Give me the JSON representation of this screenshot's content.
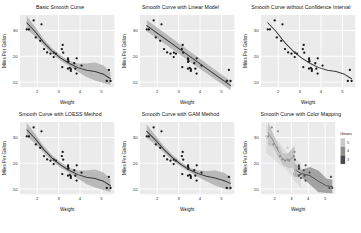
{
  "figure": {
    "caption": "",
    "axis": {
      "xlabel": "Weight",
      "ylabel": "Miles Per Gallon"
    },
    "legend": {
      "title": "Gears",
      "labels": [
        "3",
        "4",
        "5"
      ],
      "position": "right"
    },
    "colors": {
      "panel_bg": "#ebebeb",
      "grid": "#ffffff",
      "point": "#1a1a1a",
      "smooth_line": "#3b3b3b",
      "ribbon": "#b0b0b0",
      "gear3": "#4a4a4a",
      "gear4": "#8f8f8f",
      "gear5": "#c9c9c9"
    }
  },
  "chart_data": [
    {
      "type": "scatter",
      "title": "Basic Smooth Curve",
      "xlabel": "Weight",
      "ylabel": "Miles Per Gallon",
      "xlim": [
        1.2,
        5.6
      ],
      "ylim": [
        8,
        36
      ],
      "xticks": [
        2,
        3,
        4,
        5
      ],
      "yticks": [
        10,
        20,
        30
      ],
      "grid": true,
      "smooth_method": "loess",
      "confidence_interval": true,
      "x": [
        2.62,
        2.875,
        2.32,
        3.215,
        3.44,
        3.46,
        3.57,
        3.19,
        3.15,
        3.44,
        3.44,
        4.07,
        3.73,
        3.78,
        5.25,
        5.424,
        5.345,
        2.2,
        1.615,
        1.835,
        2.465,
        3.52,
        3.435,
        3.84,
        3.845,
        1.935,
        2.14,
        1.513,
        3.17,
        2.77,
        3.57,
        2.78
      ],
      "y": [
        21,
        21,
        22.8,
        21.4,
        18.7,
        18.1,
        14.3,
        24.4,
        22.8,
        19.2,
        17.8,
        16.4,
        17.3,
        15.2,
        10.4,
        10.4,
        14.7,
        32.4,
        30.4,
        33.9,
        21.5,
        15.5,
        15.2,
        13.3,
        19.2,
        27.3,
        26,
        30.4,
        15.8,
        19.7,
        15,
        21.4
      ],
      "smooth_x": [
        1.513,
        1.9,
        2.3,
        2.7,
        3.1,
        3.5,
        3.9,
        4.3,
        4.7,
        5.1,
        5.424
      ],
      "smooth_y": [
        33.0,
        29.6,
        25.4,
        22.0,
        19.3,
        17.2,
        15.6,
        14.6,
        14.1,
        13.0,
        11.3
      ],
      "ribbon_lo": [
        30.4,
        27.8,
        24.1,
        20.9,
        18.3,
        16.2,
        14.0,
        12.0,
        10.6,
        9.6,
        8.9
      ],
      "ribbon_hi": [
        35.6,
        31.4,
        26.7,
        23.1,
        20.3,
        18.2,
        17.2,
        17.2,
        17.6,
        16.4,
        13.7
      ]
    },
    {
      "type": "scatter",
      "title": "Smooth Curve with Linear Model",
      "xlabel": "Weight",
      "ylabel": "Miles Per Gallon",
      "xlim": [
        1.2,
        5.6
      ],
      "ylim": [
        8,
        36
      ],
      "xticks": [
        2,
        3,
        4,
        5
      ],
      "yticks": [
        10,
        20,
        30
      ],
      "grid": true,
      "smooth_method": "lm",
      "confidence_interval": true,
      "x": [
        2.62,
        2.875,
        2.32,
        3.215,
        3.44,
        3.46,
        3.57,
        3.19,
        3.15,
        3.44,
        3.44,
        4.07,
        3.73,
        3.78,
        5.25,
        5.424,
        5.345,
        2.2,
        1.615,
        1.835,
        2.465,
        3.52,
        3.435,
        3.84,
        3.845,
        1.935,
        2.14,
        1.513,
        3.17,
        2.77,
        3.57,
        2.78
      ],
      "y": [
        21,
        21,
        22.8,
        21.4,
        18.7,
        18.1,
        14.3,
        24.4,
        22.8,
        19.2,
        17.8,
        16.4,
        17.3,
        15.2,
        10.4,
        10.4,
        14.7,
        32.4,
        30.4,
        33.9,
        21.5,
        15.5,
        15.2,
        13.3,
        19.2,
        27.3,
        26,
        30.4,
        15.8,
        19.7,
        15,
        21.4
      ],
      "smooth_x": [
        1.513,
        5.424
      ],
      "smooth_y": [
        31.9,
        8.6
      ],
      "ribbon_lo": [
        29.7,
        6.8
      ],
      "ribbon_hi": [
        34.1,
        10.4
      ]
    },
    {
      "type": "scatter",
      "title": "Smooth Curve without Confidence Interval",
      "xlabel": "Weight",
      "ylabel": "Miles Per Gallon",
      "xlim": [
        1.2,
        5.6
      ],
      "ylim": [
        8,
        36
      ],
      "xticks": [
        2,
        3,
        4,
        5
      ],
      "yticks": [
        10,
        20,
        30
      ],
      "grid": true,
      "smooth_method": "loess",
      "confidence_interval": false,
      "x": [
        2.62,
        2.875,
        2.32,
        3.215,
        3.44,
        3.46,
        3.57,
        3.19,
        3.15,
        3.44,
        3.44,
        4.07,
        3.73,
        3.78,
        5.25,
        5.424,
        5.345,
        2.2,
        1.615,
        1.835,
        2.465,
        3.52,
        3.435,
        3.84,
        3.845,
        1.935,
        2.14,
        1.513,
        3.17,
        2.77,
        3.57,
        2.78
      ],
      "y": [
        21,
        21,
        22.8,
        21.4,
        18.7,
        18.1,
        14.3,
        24.4,
        22.8,
        19.2,
        17.8,
        16.4,
        17.3,
        15.2,
        10.4,
        10.4,
        14.7,
        32.4,
        30.4,
        33.9,
        21.5,
        15.5,
        15.2,
        13.3,
        19.2,
        27.3,
        26,
        30.4,
        15.8,
        19.7,
        15,
        21.4
      ],
      "smooth_x": [
        1.513,
        1.9,
        2.3,
        2.7,
        3.1,
        3.5,
        3.9,
        4.3,
        4.7,
        5.1,
        5.424
      ],
      "smooth_y": [
        33.0,
        29.6,
        25.4,
        22.0,
        19.3,
        17.2,
        15.6,
        14.6,
        14.1,
        13.0,
        11.3
      ]
    },
    {
      "type": "scatter",
      "title": "Smooth Curve with LOESS Method",
      "xlabel": "Weight",
      "ylabel": "Miles Per Gallon",
      "xlim": [
        1.2,
        5.6
      ],
      "ylim": [
        8,
        36
      ],
      "xticks": [
        2,
        3,
        4,
        5
      ],
      "yticks": [
        10,
        20,
        30
      ],
      "grid": true,
      "smooth_method": "loess",
      "confidence_interval": true,
      "x": [
        2.62,
        2.875,
        2.32,
        3.215,
        3.44,
        3.46,
        3.57,
        3.19,
        3.15,
        3.44,
        3.44,
        4.07,
        3.73,
        3.78,
        5.25,
        5.424,
        5.345,
        2.2,
        1.615,
        1.835,
        2.465,
        3.52,
        3.435,
        3.84,
        3.845,
        1.935,
        2.14,
        1.513,
        3.17,
        2.77,
        3.57,
        2.78
      ],
      "y": [
        21,
        21,
        22.8,
        21.4,
        18.7,
        18.1,
        14.3,
        24.4,
        22.8,
        19.2,
        17.8,
        16.4,
        17.3,
        15.2,
        10.4,
        10.4,
        14.7,
        32.4,
        30.4,
        33.9,
        21.5,
        15.5,
        15.2,
        13.3,
        19.2,
        27.3,
        26,
        30.4,
        15.8,
        19.7,
        15,
        21.4
      ],
      "smooth_x": [
        1.513,
        1.9,
        2.3,
        2.7,
        3.1,
        3.5,
        3.9,
        4.3,
        4.7,
        5.1,
        5.424
      ],
      "smooth_y": [
        33.0,
        29.6,
        25.4,
        22.0,
        19.3,
        17.2,
        15.6,
        14.6,
        14.1,
        13.0,
        11.3
      ],
      "ribbon_lo": [
        30.4,
        27.8,
        24.1,
        20.9,
        18.3,
        16.2,
        14.0,
        12.0,
        10.6,
        9.6,
        8.9
      ],
      "ribbon_hi": [
        35.6,
        31.4,
        26.7,
        23.1,
        20.3,
        18.2,
        17.2,
        17.2,
        17.6,
        16.4,
        13.7
      ]
    },
    {
      "type": "scatter",
      "title": "Smooth Curve with GAM Method",
      "xlabel": "Weight",
      "ylabel": "Miles Per Gallon",
      "xlim": [
        1.2,
        5.6
      ],
      "ylim": [
        8,
        36
      ],
      "xticks": [
        2,
        3,
        4,
        5
      ],
      "yticks": [
        10,
        20,
        30
      ],
      "grid": true,
      "smooth_method": "gam",
      "confidence_interval": true,
      "x": [
        2.62,
        2.875,
        2.32,
        3.215,
        3.44,
        3.46,
        3.57,
        3.19,
        3.15,
        3.44,
        3.44,
        4.07,
        3.73,
        3.78,
        5.25,
        5.424,
        5.345,
        2.2,
        1.615,
        1.835,
        2.465,
        3.52,
        3.435,
        3.84,
        3.845,
        1.935,
        2.14,
        1.513,
        3.17,
        2.77,
        3.57,
        2.78
      ],
      "y": [
        21,
        21,
        22.8,
        21.4,
        18.7,
        18.1,
        14.3,
        24.4,
        22.8,
        19.2,
        17.8,
        16.4,
        17.3,
        15.2,
        10.4,
        10.4,
        14.7,
        32.4,
        30.4,
        33.9,
        21.5,
        15.5,
        15.2,
        13.3,
        19.2,
        27.3,
        26,
        30.4,
        15.8,
        19.7,
        15,
        21.4
      ],
      "smooth_x": [
        1.513,
        1.9,
        2.3,
        2.7,
        3.1,
        3.5,
        3.9,
        4.3,
        4.7,
        5.1,
        5.424
      ],
      "smooth_y": [
        32.4,
        29.2,
        25.5,
        22.3,
        19.6,
        17.5,
        16.0,
        15.0,
        14.3,
        13.3,
        12.2
      ],
      "ribbon_lo": [
        29.8,
        27.4,
        24.2,
        21.2,
        18.7,
        16.7,
        14.7,
        13.0,
        11.4,
        10.2,
        9.6
      ],
      "ribbon_hi": [
        35.0,
        31.0,
        26.8,
        23.4,
        20.5,
        18.3,
        17.3,
        17.0,
        17.2,
        16.4,
        14.8
      ]
    },
    {
      "type": "scatter",
      "title": "Smooth Curve with Color Mapping",
      "xlabel": "Weight",
      "ylabel": "Miles Per Gallon",
      "xlim": [
        1.2,
        5.6
      ],
      "ylim": [
        8,
        36
      ],
      "xticks": [
        2,
        3,
        4,
        5
      ],
      "yticks": [
        10,
        20,
        30
      ],
      "grid": true,
      "smooth_method": "loess",
      "confidence_interval": true,
      "color_by": "Gears",
      "series": [
        {
          "name": "3",
          "x": [
            3.215,
            3.44,
            3.46,
            3.57,
            3.44,
            3.44,
            4.07,
            3.73,
            3.78,
            5.25,
            5.424,
            5.345,
            3.52,
            3.435,
            3.84,
            3.845,
            3.17
          ],
          "y": [
            21.4,
            18.7,
            18.1,
            14.3,
            19.2,
            17.8,
            16.4,
            17.3,
            15.2,
            10.4,
            10.4,
            14.7,
            15.5,
            15.2,
            13.3,
            19.2,
            15.8
          ],
          "smooth_x": [
            3.17,
            3.6,
            4.1,
            4.6,
            5.1,
            5.424
          ],
          "smooth_y": [
            17.5,
            16.0,
            15.2,
            13.0,
            11.2,
            11.0
          ],
          "ribbon_lo": [
            14.8,
            14.5,
            11.8,
            8.8,
            8.5,
            8.4
          ],
          "ribbon_hi": [
            20.2,
            17.5,
            18.6,
            17.2,
            14.0,
            13.6
          ]
        },
        {
          "name": "4",
          "x": [
            2.62,
            2.875,
            2.32,
            3.19,
            3.15,
            2.2,
            1.615,
            1.835,
            2.465,
            1.935,
            2.14,
            2.78
          ],
          "y": [
            21,
            21,
            22.8,
            24.4,
            22.8,
            32.4,
            30.4,
            33.9,
            21.5,
            27.3,
            26,
            21.4
          ],
          "smooth_x": [
            1.615,
            1.9,
            2.2,
            2.5,
            2.8,
            3.19
          ],
          "smooth_y": [
            31.8,
            29.0,
            25.0,
            21.6,
            21.0,
            22.6
          ],
          "ribbon_lo": [
            27.0,
            26.4,
            22.6,
            19.4,
            18.2,
            18.4
          ],
          "ribbon_hi": [
            36.0,
            31.6,
            27.4,
            23.8,
            23.8,
            26.8
          ]
        },
        {
          "name": "5",
          "x": [
            1.513,
            2.77,
            3.57,
            2.77,
            3.17
          ],
          "y": [
            30.4,
            19.7,
            15,
            26,
            15.8
          ],
          "smooth_x": [
            1.513,
            2.1,
            2.7,
            3.2,
            3.57
          ],
          "smooth_y": [
            30.4,
            25.0,
            21.0,
            17.4,
            15.2
          ],
          "ribbon_lo": [
            24.0,
            20.6,
            17.6,
            13.0,
            10.4
          ],
          "ribbon_hi": [
            35.4,
            29.4,
            24.4,
            21.8,
            20.0
          ]
        }
      ]
    }
  ]
}
